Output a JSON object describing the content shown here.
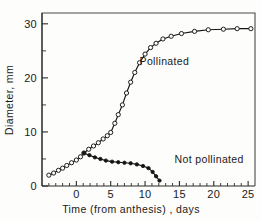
{
  "chart_data": {
    "type": "line",
    "title": "",
    "xlabel": "Time (from anthesis) , days",
    "ylabel": "Diameter, mm",
    "xlim": [
      -5,
      26
    ],
    "ylim": [
      0,
      32
    ],
    "x_ticks_major": [
      0,
      5,
      10,
      15,
      20,
      25
    ],
    "x_tick_labels": [
      "0",
      "5",
      "10",
      "15",
      "20",
      "25"
    ],
    "x_ticks_minor": [
      -4,
      -3,
      -2,
      -1,
      1,
      2,
      3,
      4,
      6,
      7,
      8,
      9,
      11,
      12,
      13,
      14,
      16,
      17,
      18,
      19,
      21,
      22,
      23,
      24
    ],
    "y_ticks_major": [
      0,
      10,
      20,
      30
    ],
    "y_tick_labels": [
      "0",
      "10",
      "20",
      "30"
    ],
    "y_ticks_minor": [
      5,
      15,
      25
    ],
    "grid": false,
    "legend_position": "inline-annotation",
    "series": [
      {
        "name": "Pollinated",
        "marker": "open-circle",
        "label_x": 9.2,
        "label_y": 22.3,
        "points": [
          {
            "x": -4.0,
            "y": 2.0
          },
          {
            "x": -3.3,
            "y": 2.4
          },
          {
            "x": -2.6,
            "y": 2.9
          },
          {
            "x": -2.0,
            "y": 3.3
          },
          {
            "x": -1.4,
            "y": 3.8
          },
          {
            "x": -0.7,
            "y": 4.3
          },
          {
            "x": 0.0,
            "y": 4.8
          },
          {
            "x": 0.6,
            "y": 5.4
          },
          {
            "x": 1.1,
            "y": 6.1
          },
          {
            "x": 1.8,
            "y": 6.8
          },
          {
            "x": 2.5,
            "y": 7.4
          },
          {
            "x": 3.2,
            "y": 8.0
          },
          {
            "x": 3.9,
            "y": 8.7
          },
          {
            "x": 4.5,
            "y": 9.3
          },
          {
            "x": 5.0,
            "y": 9.9
          },
          {
            "x": 5.6,
            "y": 11.6
          },
          {
            "x": 6.1,
            "y": 13.2
          },
          {
            "x": 6.7,
            "y": 15.0
          },
          {
            "x": 7.3,
            "y": 17.2
          },
          {
            "x": 7.9,
            "y": 19.2
          },
          {
            "x": 8.5,
            "y": 21.0
          },
          {
            "x": 9.2,
            "y": 22.8
          },
          {
            "x": 10.0,
            "y": 24.4
          },
          {
            "x": 10.8,
            "y": 25.6
          },
          {
            "x": 11.6,
            "y": 26.4
          },
          {
            "x": 12.6,
            "y": 27.2
          },
          {
            "x": 13.8,
            "y": 27.7
          },
          {
            "x": 15.3,
            "y": 28.2
          },
          {
            "x": 17.2,
            "y": 28.6
          },
          {
            "x": 19.2,
            "y": 28.9
          },
          {
            "x": 21.4,
            "y": 29.0
          },
          {
            "x": 23.4,
            "y": 29.1
          },
          {
            "x": 25.4,
            "y": 29.1
          }
        ]
      },
      {
        "name": "Not pollinated",
        "marker": "filled-circle",
        "label_x": 14.3,
        "label_y": 4.3,
        "points": [
          {
            "x": 1.1,
            "y": 6.1
          },
          {
            "x": 1.9,
            "y": 5.7
          },
          {
            "x": 2.7,
            "y": 5.3
          },
          {
            "x": 3.5,
            "y": 5.0
          },
          {
            "x": 4.3,
            "y": 4.7
          },
          {
            "x": 5.2,
            "y": 4.5
          },
          {
            "x": 6.1,
            "y": 4.4
          },
          {
            "x": 7.0,
            "y": 4.3
          },
          {
            "x": 7.9,
            "y": 4.2
          },
          {
            "x": 8.8,
            "y": 4.0
          },
          {
            "x": 9.7,
            "y": 3.7
          },
          {
            "x": 10.5,
            "y": 3.3
          },
          {
            "x": 11.1,
            "y": 2.6
          },
          {
            "x": 11.6,
            "y": 1.8
          },
          {
            "x": 12.1,
            "y": 1.0
          }
        ]
      }
    ]
  }
}
